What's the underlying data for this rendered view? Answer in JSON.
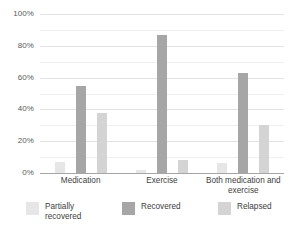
{
  "chart_data": {
    "type": "bar",
    "title": "",
    "subtitle": "",
    "xlabel": "",
    "ylabel": "",
    "ylim": [
      0,
      100
    ],
    "ytick_labels": [
      "0%",
      "20%",
      "40%",
      "60%",
      "80%",
      "100%"
    ],
    "ytick_values": [
      0,
      20,
      40,
      60,
      80,
      100
    ],
    "minor_tick_values": [
      10,
      30,
      50,
      70,
      90
    ],
    "grid": true,
    "legend_position": "bottom",
    "categories": [
      "Medication",
      "Exercise",
      "Both medication and exercise"
    ],
    "series": [
      {
        "name": "Partially recovered",
        "color": "#e6e6e6",
        "values": [
          7,
          2,
          6
        ]
      },
      {
        "name": "Recovered",
        "color": "#a6a6a6",
        "values": [
          55,
          87,
          63
        ]
      },
      {
        "name": "Relapsed",
        "color": "#d4d4d4",
        "values": [
          38,
          8,
          30
        ]
      }
    ]
  },
  "axis": {
    "y_ticks": [
      {
        "label": "100%",
        "value": 100
      },
      {
        "label": "80%",
        "value": 80
      },
      {
        "label": "60%",
        "value": 60
      },
      {
        "label": "40%",
        "value": 40
      },
      {
        "label": "20%",
        "value": 20
      },
      {
        "label": "0%",
        "value": 0
      }
    ]
  },
  "categories": [
    {
      "label": "Medication"
    },
    {
      "label": "Exercise"
    },
    {
      "label": "Both medication and exercise"
    }
  ],
  "legend": [
    {
      "label": "Partially recovered",
      "color": "#e6e6e6"
    },
    {
      "label": "Recovered",
      "color": "#a6a6a6"
    },
    {
      "label": "Relapsed",
      "color": "#d4d4d4"
    }
  ]
}
